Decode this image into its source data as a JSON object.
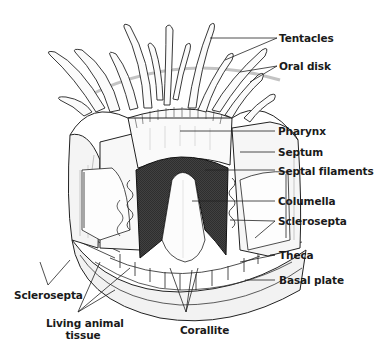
{
  "diagram": {
    "labels": {
      "tentacles": "Tentacles",
      "oral_disk": "Oral disk",
      "pharynx": "Pharynx",
      "septum": "Septum",
      "septal_filaments": "Septal filaments",
      "columella": "Columella",
      "sclerosepta_right": "Sclerosepta",
      "theca": "Theca",
      "basal_plate": "Basal plate",
      "sclerosepta_left": "Sclerosepta",
      "living_animal_tissue_line1": "Living animal",
      "living_animal_tissue_line2": "tissue",
      "corallite": "Corallite"
    },
    "colors": {
      "ink": "#1a1a1a",
      "shade": "#9a9a9a",
      "dark_filaments": "#3a3a3a",
      "background": "#ffffff"
    }
  }
}
